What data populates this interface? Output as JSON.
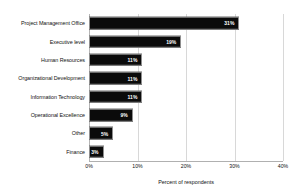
{
  "chart_data": {
    "type": "bar",
    "orientation": "horizontal",
    "title": "",
    "subtitle": "",
    "xlabel": "Percent of respondents",
    "ylabel": "",
    "xlim": [
      0,
      40
    ],
    "xticks": [
      "0%",
      "10%",
      "20%",
      "30%",
      "40%"
    ],
    "xtick_values": [
      0,
      10,
      20,
      30,
      40
    ],
    "grid": true,
    "legend": false,
    "bar_color": "#0b0b0b",
    "label_color": "#ffffff",
    "gridline_color": "#d8d8d8",
    "categories": [
      "Project Management Office",
      "Executive level",
      "Human Resources",
      "Organizational Development",
      "Information Technology",
      "Operational Excellence",
      "Other",
      "Finance"
    ],
    "values": [
      31,
      19,
      11,
      11,
      11,
      9,
      5,
      3
    ],
    "data_labels": [
      "31%",
      "19%",
      "11%",
      "11%",
      "11%",
      "9%",
      "5%",
      "3%"
    ]
  }
}
